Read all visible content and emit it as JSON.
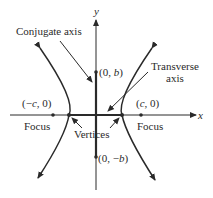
{
  "diagram": {
    "axes": {
      "x_label": "x",
      "y_label": "y"
    },
    "labels": {
      "conjugate_axis": "Conjugate axis",
      "transverse_axis_line1": "Transverse",
      "transverse_axis_line2": "axis",
      "point_0_b": "(0, b)",
      "point_0_neg_b": "(0, −b)",
      "point_neg_c_0": "(−c, 0)",
      "point_c_0": "(c, 0)",
      "focus_left": "Focus",
      "focus_right": "Focus",
      "vertices": "Vertices"
    },
    "colors": {
      "stroke": "#2a2a2a",
      "background": "#ffffff"
    }
  }
}
